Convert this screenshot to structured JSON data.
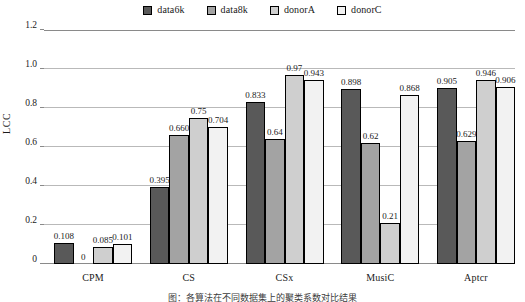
{
  "chart_data": {
    "type": "bar",
    "title": "",
    "xlabel": "",
    "ylabel": "LCC",
    "ylim": [
      0,
      1.2
    ],
    "yticks": [
      "0",
      "0.2",
      "0.4",
      "0.6",
      "0.8",
      "1.0",
      "1.2"
    ],
    "ytick_values": [
      0,
      0.2,
      0.4,
      0.6,
      0.8,
      1.0,
      1.2
    ],
    "grid": true,
    "legend_position": "top-center",
    "categories": [
      "CPM",
      "CS",
      "CSx",
      "MusiC",
      "Aptcr"
    ],
    "series": [
      {
        "name": "data6k",
        "color": "#595959",
        "values": [
          0.108,
          0.395,
          0.833,
          0.898,
          0.905
        ],
        "labels": [
          "0.108",
          "0.395",
          "0.833",
          "0.898",
          "0.905"
        ]
      },
      {
        "name": "data8k",
        "color": "#a3a3a3",
        "values": [
          0,
          0.66,
          0.64,
          0.62,
          0.629
        ],
        "labels": [
          "0",
          "0.660",
          "0.64",
          "0.62",
          "0.629"
        ]
      },
      {
        "name": "donorA",
        "color": "#cfcfcf",
        "values": [
          0.085,
          0.75,
          0.97,
          0.21,
          0.946
        ],
        "labels": [
          "0.085",
          "0.75",
          "0.97",
          "0.21",
          "0.946"
        ]
      },
      {
        "name": "donorC",
        "color": "#f2f2f2",
        "values": [
          0.101,
          0.704,
          0.943,
          0.868,
          0.906
        ],
        "labels": [
          "0.101",
          "0.704",
          "0.943",
          "0.868",
          "0.906"
        ]
      }
    ]
  },
  "legend": {
    "items": [
      {
        "label": "data6k",
        "color": "#595959"
      },
      {
        "label": "data8k",
        "color": "#a3a3a3"
      },
      {
        "label": "donorA",
        "color": "#cfcfcf"
      },
      {
        "label": "donorC",
        "color": "#f2f2f2"
      }
    ]
  },
  "caption": {
    "text": "图：各算法在不同数据集上的聚类系数对比结果"
  }
}
